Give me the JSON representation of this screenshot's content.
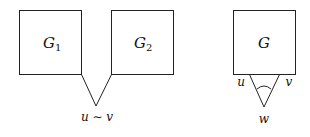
{
  "left_figure": {
    "graph1": {
      "label": "G",
      "subscript": "1"
    },
    "graph2": {
      "label": "G",
      "subscript": "2"
    },
    "merged_vertex_label": "u ∼ v"
  },
  "right_figure": {
    "graph": {
      "label": "G"
    },
    "vertex_u": "u",
    "vertex_v": "v",
    "vertex_w": "w"
  }
}
